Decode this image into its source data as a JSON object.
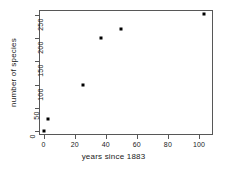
{
  "chart_data": {
    "type": "scatter",
    "title": "",
    "xlabel": "years since 1883",
    "ylabel": "number of species",
    "xlim": [
      -3,
      109
    ],
    "ylim": [
      -9,
      261
    ],
    "grid": false,
    "legend": null,
    "xticks": [
      0,
      20,
      40,
      60,
      80,
      100
    ],
    "xtick_labels": [
      "0",
      "20",
      "40",
      "60",
      "80",
      "100"
    ],
    "yticks": [
      0,
      50,
      100,
      150,
      200,
      250
    ],
    "ytick_labels": [
      "0",
      "50",
      "100",
      "150",
      "200",
      "250"
    ],
    "marker": "filled-square",
    "marker_color": "#000000",
    "points": [
      {
        "x": 0,
        "y": 0
      },
      {
        "x": 3,
        "y": 25
      },
      {
        "x": 25,
        "y": 100
      },
      {
        "x": 37,
        "y": 200
      },
      {
        "x": 50,
        "y": 220
      },
      {
        "x": 103,
        "y": 252
      }
    ],
    "x": [
      0,
      3,
      25,
      37,
      50,
      103
    ],
    "values": [
      0,
      25,
      100,
      200,
      220,
      252
    ]
  },
  "style": {
    "axis_color": "#575757",
    "text_color": "#1a1a1a",
    "background": "#ffffff"
  }
}
